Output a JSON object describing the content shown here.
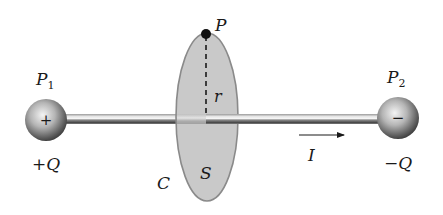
{
  "diagram": {
    "labels": {
      "p1": "P",
      "p1_sub": "1",
      "p2": "P",
      "p2_sub": "2",
      "plus_q": "+Q",
      "minus_q": "−Q",
      "plus_sign": "+",
      "minus_sign": "−",
      "point_p": "P",
      "radius": "r",
      "curve": "C",
      "surface": "S",
      "current": "I"
    },
    "elements": [
      {
        "name": "positive-sphere",
        "label": "P1",
        "charge": "+Q",
        "center": [
          46,
          120
        ],
        "radius": 21
      },
      {
        "name": "negative-sphere",
        "label": "P2",
        "charge": "-Q",
        "center": [
          398,
          118
        ],
        "radius": 21
      },
      {
        "name": "wire",
        "from": [
          66,
          119
        ],
        "to": [
          378,
          119
        ]
      },
      {
        "name": "surface-disk",
        "label": "S",
        "boundary": "C",
        "center": [
          207,
          117
        ],
        "rx": 31,
        "ry": 84
      },
      {
        "name": "point-p",
        "label": "P",
        "position": [
          206,
          33
        ]
      },
      {
        "name": "radius-line",
        "label": "r",
        "from": [
          206,
          33
        ],
        "to": [
          206,
          118
        ],
        "style": "dashed"
      },
      {
        "name": "current-arrow",
        "label": "I",
        "from": [
          300,
          135
        ],
        "to": [
          344,
          135
        ]
      }
    ],
    "colors": {
      "disk_fill": "#c8c8c8",
      "disk_stroke": "#8a8a8a",
      "sphere_light": "#f2f2f2",
      "sphere_dark": "#3a3a3a",
      "wire_light": "#e0e0e0",
      "wire_dark": "#4a4a4a",
      "ink": "#1a1a1a"
    }
  }
}
